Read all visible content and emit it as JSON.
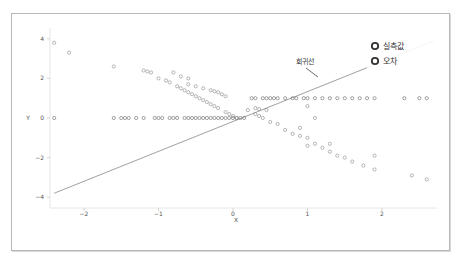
{
  "chart_data": {
    "type": "scatter",
    "title": "",
    "xlabel": "X",
    "ylabel": "Y",
    "xlim": [
      -2.45,
      2.75
    ],
    "ylim": [
      -4.3,
      4.1
    ],
    "xticks": [
      -2,
      -1,
      0,
      1,
      2
    ],
    "yticks": [
      4,
      2,
      0,
      -2,
      -4
    ],
    "grid": false,
    "legend_position": "upper right",
    "legend": [
      "실측값",
      "오차"
    ],
    "annotation": {
      "text": "회귀선",
      "x": 0.9,
      "y": 2.0
    },
    "regression_line": {
      "x": [
        -2.4,
        2.7
      ],
      "y": [
        -3.8,
        3.9
      ]
    },
    "series": [
      {
        "name": "실측값",
        "x": [
          -2.4,
          -1.6,
          -1.5,
          -1.45,
          -1.4,
          -1.3,
          -1.2,
          -1.05,
          -1.0,
          -0.95,
          -0.85,
          -0.8,
          -0.75,
          -0.65,
          -0.6,
          -0.55,
          -0.5,
          -0.45,
          -0.4,
          -0.35,
          -0.3,
          -0.25,
          -0.2,
          -0.15,
          -0.1,
          -0.05,
          0.0,
          0.05,
          0.1,
          0.15,
          0.25,
          0.3,
          0.4,
          0.45,
          0.5,
          0.55,
          0.6,
          0.7,
          0.8,
          0.85,
          0.95,
          1.0,
          1.1,
          1.2,
          1.3,
          1.4,
          1.5,
          1.6,
          1.7,
          1.8,
          1.9,
          2.3,
          2.5,
          2.6
        ],
        "y": [
          0,
          0,
          0,
          0,
          0,
          0,
          0,
          0,
          0,
          0,
          0,
          0,
          0,
          0,
          0,
          0,
          0,
          0,
          0,
          0,
          0,
          0,
          0,
          0,
          0,
          0,
          0,
          0,
          0,
          0,
          1,
          1,
          1,
          1,
          1,
          1,
          1,
          1,
          1,
          1,
          1,
          1,
          1,
          1,
          1,
          1,
          1,
          1,
          1,
          1,
          1,
          1,
          1,
          1
        ]
      },
      {
        "name": "오차",
        "x": [
          -2.4,
          -1.6,
          -1.2,
          -1.15,
          -1.1,
          -1.0,
          -0.9,
          -0.85,
          -0.75,
          -0.7,
          -0.65,
          -0.6,
          -0.55,
          -0.5,
          -0.45,
          -0.4,
          -0.35,
          -0.3,
          -0.25,
          -0.2,
          -0.1,
          -0.05,
          0.0,
          0.05,
          0.2,
          0.3,
          0.35,
          0.4,
          0.5,
          0.6,
          0.7,
          0.8,
          0.9,
          1.0,
          1.1,
          1.2,
          1.3,
          1.4,
          1.5,
          1.6,
          1.75,
          1.9,
          2.4,
          2.6,
          -0.6,
          -0.5,
          -0.4,
          -0.3,
          -0.25,
          -0.2,
          -0.15,
          -0.1,
          0.3,
          0.35,
          0.45,
          -2.2,
          -0.8,
          -0.7,
          -0.6,
          0.9,
          1.0,
          1.3,
          1.9,
          1.0,
          1.1
        ],
        "y": [
          3.8,
          2.6,
          2.4,
          2.35,
          2.3,
          2.0,
          1.9,
          1.8,
          1.6,
          1.5,
          1.4,
          1.3,
          1.2,
          1.1,
          1.0,
          0.9,
          0.8,
          0.7,
          0.6,
          0.5,
          0.3,
          0.2,
          0.1,
          0.0,
          0.4,
          0.2,
          0.1,
          0.0,
          -0.2,
          -0.3,
          -0.6,
          -0.8,
          -0.9,
          -1.0,
          -1.3,
          -1.5,
          -1.7,
          -1.9,
          -2.0,
          -2.2,
          -2.4,
          -2.6,
          -2.9,
          -3.1,
          1.7,
          1.6,
          1.5,
          1.4,
          1.35,
          1.3,
          1.2,
          1.1,
          0.5,
          0.45,
          0.4,
          3.3,
          2.3,
          2.1,
          2.0,
          -0.5,
          -1.4,
          -1.3,
          -1.9,
          0.6,
          0.0
        ]
      }
    ]
  }
}
